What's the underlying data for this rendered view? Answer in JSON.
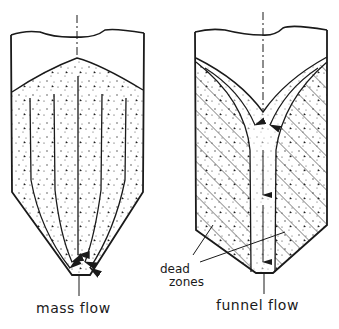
{
  "figure": {
    "left_panel": {
      "caption": "mass flow",
      "description": "Silo with converging hopper; all material moves, flow lines converge to outlet"
    },
    "right_panel": {
      "caption": "funnel flow",
      "description": "Silo with central flow channel; stagnant material along walls",
      "annotation": {
        "line1": "dead",
        "line2": "zones"
      }
    }
  },
  "colors": {
    "ink": "#1a1a1a",
    "background": "#ffffff"
  }
}
